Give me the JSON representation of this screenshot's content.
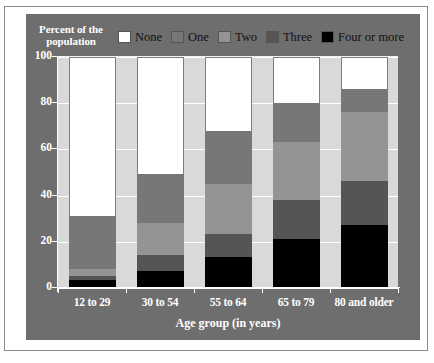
{
  "figure": {
    "y_axis_title_line1": "Percent of the",
    "y_axis_title_line2": "population",
    "x_axis_title": "Age group (in years)"
  },
  "legend": {
    "items": [
      {
        "label": "None",
        "color": "#ffffff"
      },
      {
        "label": "One",
        "color": "#777777"
      },
      {
        "label": "Two",
        "color": "#949494"
      },
      {
        "label": "Three",
        "color": "#555555"
      },
      {
        "label": "Four or more",
        "color": "#000000"
      }
    ]
  },
  "colors": {
    "panel_background": "#6e6e6e",
    "plot_background": "#d9d9d9",
    "gridline": "#ffffff",
    "axis_text": "#ffffff",
    "legend_text": "#111111",
    "figure_border": "#8a8a8a"
  },
  "chart_data": {
    "type": "bar",
    "subtype": "stacked-bar-100-percent",
    "title": "Percent of the population",
    "xlabel": "Age group (in years)",
    "ylabel": "Percent of the population",
    "ylim": [
      0,
      100
    ],
    "yticks": [
      0,
      20,
      40,
      60,
      80,
      100
    ],
    "ytick_labels": [
      "0",
      "20",
      "40",
      "60",
      "80",
      "100"
    ],
    "grid": true,
    "legend_position": "top",
    "categories": [
      "12 to 29",
      "30 to 54",
      "55 to 64",
      "65 to 79",
      "80 and older"
    ],
    "series": [
      {
        "name": "Four or more",
        "color": "#000000",
        "values": [
          3,
          7,
          13,
          21,
          27
        ]
      },
      {
        "name": "Three",
        "color": "#555555",
        "values": [
          2,
          7,
          10,
          17,
          19
        ]
      },
      {
        "name": "Two",
        "color": "#949494",
        "values": [
          3,
          14,
          22,
          25,
          30
        ]
      },
      {
        "name": "One",
        "color": "#777777",
        "values": [
          23,
          21,
          23,
          17,
          10
        ]
      },
      {
        "name": "None",
        "color": "#ffffff",
        "values": [
          69,
          51,
          32,
          20,
          14
        ]
      }
    ]
  }
}
